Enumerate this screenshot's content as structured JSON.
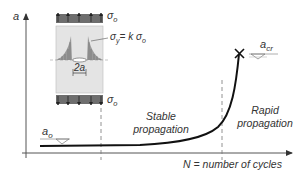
{
  "figure": {
    "y_axis_label": "a",
    "x_axis_label": "N = number of cycles",
    "regions": [
      {
        "line1": "Stable",
        "line2": "propagation"
      },
      {
        "line1": "Rapid",
        "line2": "propagation"
      }
    ],
    "markers": {
      "initial_crack": "a",
      "initial_crack_sub": "o",
      "critical_crack": "a",
      "critical_crack_sub": "cr"
    },
    "specimen": {
      "top_stress": "σ",
      "top_stress_sub": "o",
      "bottom_stress": "σ",
      "bottom_stress_sub": "o",
      "stress_relation_lhs": "σ",
      "stress_relation_lhs_sub": "y",
      "stress_relation_rhs": "= k σ",
      "stress_relation_rhs_sub": "o",
      "crack_width": "2a"
    },
    "colors": {
      "axis": "#333333",
      "curve": "#111111",
      "load_band": "#6e6e6e",
      "specimen_body": "#e4e4e4",
      "dashed": "#777777"
    }
  }
}
